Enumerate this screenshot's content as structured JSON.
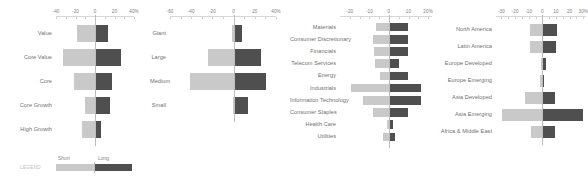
{
  "legend": {
    "title": "LEGEND",
    "short_label": "Short",
    "long_label": "Long",
    "short_color": "#c9c9c9",
    "long_color": "#4f4f4f"
  },
  "chart_data": [
    {
      "id": "style",
      "type": "bar",
      "orientation": "horizontal",
      "layout": "diverging",
      "title": "",
      "xlabel": "",
      "ylabel": "",
      "grid": false,
      "legend_position": "bottom-left",
      "xlim": [
        -40,
        40
      ],
      "ticks": [
        -40,
        -20,
        0,
        20,
        40
      ],
      "tick_labels": [
        "-40",
        "-20",
        "0",
        "20",
        "40%"
      ],
      "categories": [
        "Value",
        "Core Value",
        "Core",
        "Core Growth",
        "High Growth"
      ],
      "series": [
        {
          "name": "Short",
          "values": [
            -18.5,
            -32.5,
            -21.5,
            -10.5,
            -13.0
          ]
        },
        {
          "name": "Long",
          "values": [
            13.5,
            27.0,
            17.5,
            15.0,
            6.0
          ]
        }
      ]
    },
    {
      "id": "size",
      "type": "bar",
      "orientation": "horizontal",
      "layout": "diverging",
      "title": "",
      "xlabel": "",
      "ylabel": "",
      "grid": false,
      "xlim": [
        -60,
        40
      ],
      "ticks": [
        -60,
        -40,
        -20,
        0,
        20,
        40
      ],
      "tick_labels": [
        "-60",
        "-40",
        "-20",
        "0",
        "20",
        "40%"
      ],
      "categories": [
        "Giant",
        "Large",
        "Medium",
        "Small"
      ],
      "series": [
        {
          "name": "Short",
          "values": [
            -1.5,
            -24.0,
            -41.0,
            -1.0
          ]
        },
        {
          "name": "Long",
          "values": [
            7.5,
            25.5,
            30.5,
            13.5
          ]
        }
      ]
    },
    {
      "id": "sector",
      "type": "bar",
      "orientation": "horizontal",
      "layout": "diverging",
      "title": "",
      "xlabel": "",
      "ylabel": "",
      "grid": false,
      "xlim": [
        -25,
        22
      ],
      "ticks": [
        -20,
        -10,
        0,
        10,
        20
      ],
      "tick_labels": [
        "-20",
        "-10",
        "0",
        "10",
        "20%"
      ],
      "categories": [
        "Materials",
        "Consumer Discretionary",
        "Financials",
        "Telecom Services",
        "Energy",
        "Industrials",
        "Information Technology",
        "Consumer Staples",
        "Health Care",
        "Utilities"
      ],
      "series": [
        {
          "name": "Short",
          "values": [
            -6.5,
            -8.0,
            -7.5,
            -7.0,
            -4.5,
            -19.5,
            -13.5,
            -8.0,
            -1.0,
            -3.0
          ]
        },
        {
          "name": "Long",
          "values": [
            10.0,
            9.5,
            9.5,
            5.0,
            9.5,
            16.5,
            16.5,
            10.0,
            2.0,
            3.0
          ]
        }
      ]
    },
    {
      "id": "region",
      "type": "bar",
      "orientation": "horizontal",
      "layout": "diverging",
      "title": "",
      "xlabel": "",
      "ylabel": "",
      "grid": false,
      "xlim": [
        -34,
        32
      ],
      "ticks": [
        -30,
        -20,
        -10,
        0,
        10,
        20,
        30
      ],
      "tick_labels": [
        "-30",
        "-20",
        "-10",
        "0",
        "10",
        "20",
        "30%"
      ],
      "categories": [
        "North America",
        "Latin America",
        "Europe Developed",
        "Europe Emerging",
        "Asia Developed",
        "Asia Emerging",
        "Africa & Middle East"
      ],
      "series": [
        {
          "name": "Short",
          "values": [
            -9.0,
            -9.0,
            -1.0,
            -1.5,
            -12.5,
            -29.5,
            -8.5
          ]
        },
        {
          "name": "Long",
          "values": [
            11.0,
            10.0,
            2.5,
            1.0,
            9.5,
            30.0,
            9.0
          ]
        }
      ]
    }
  ]
}
